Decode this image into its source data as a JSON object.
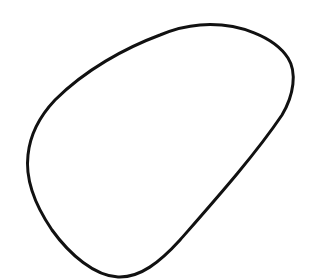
{
  "drawing": {
    "background": "#ffffff",
    "stroke_color": "#111111",
    "stroke_width": 3,
    "shape": "closed-blob",
    "path": "M 200 25 C 240 22, 275 38, 288 58 C 297 72, 294 95, 282 115 C 255 155, 215 200, 180 240 C 160 262, 140 278, 118 277 C 95 276, 70 255, 52 230 C 35 205, 25 180, 28 155 C 30 135, 38 118, 55 100 C 85 70, 125 48, 160 35 C 172 30, 186 26, 200 25 Z"
  }
}
